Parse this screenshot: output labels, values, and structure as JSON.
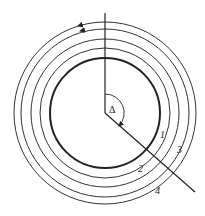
{
  "diagram": {
    "type": "concentric-circles-traverse",
    "center": [
      105,
      113
    ],
    "inner_circle_radius": 55,
    "orbits": [
      {
        "id": "1",
        "label": "1",
        "radius": 65
      },
      {
        "id": "2",
        "label": "2",
        "radius": 74
      },
      {
        "id": "3",
        "label": "3",
        "radius": 84
      },
      {
        "id": "4",
        "label": "4",
        "radius": 91
      }
    ],
    "angle_label": "Δ",
    "colors": {
      "stroke": "#222222",
      "background": "#ffffff"
    }
  }
}
